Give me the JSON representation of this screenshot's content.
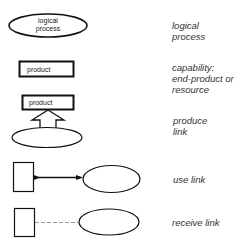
{
  "diagram": {
    "type": "legend",
    "rows": [
      {
        "symbol": "ellipse",
        "symbol_text": [
          "logical",
          "process"
        ],
        "label": [
          "logical",
          "process"
        ]
      },
      {
        "symbol": "rectangle",
        "symbol_text": [
          "product"
        ],
        "label": [
          "capability:",
          "end-product or",
          "resource"
        ]
      },
      {
        "symbol": "rectangle-with-hollow-arrow-from-ellipse",
        "symbol_text": [
          "product"
        ],
        "label": [
          "produce",
          "link"
        ]
      },
      {
        "symbol": "box-solid-arrow-ellipse",
        "symbol_text": [],
        "label": [
          "use link"
        ]
      },
      {
        "symbol": "box-dashed-line-ellipse",
        "symbol_text": [],
        "label": [
          "receive link"
        ]
      }
    ]
  },
  "colors": {
    "stroke": "#111111",
    "dashed": "#999999",
    "text": "#333333"
  }
}
